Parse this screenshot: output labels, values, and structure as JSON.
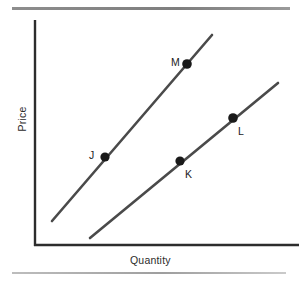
{
  "figure": {
    "kind": "supply-curve-diagram",
    "background_color": "#ffffff",
    "line_color": "#4a4a4a",
    "axis_color": "#2d2d2d",
    "point_color": "#1a1a1a",
    "rule_color": "#8a8a8a"
  },
  "axes": {
    "x_label": "Quantity",
    "y_label": "Price",
    "origin": {
      "x": 34,
      "y": 246
    },
    "x_axis_end": {
      "x": 299,
      "y": 246
    },
    "y_axis_top": {
      "x": 34,
      "y": 20
    },
    "ticks": [],
    "grid": false
  },
  "rules": {
    "top": {
      "x1": 12,
      "y1": 8,
      "x2": 290,
      "y2": 8
    },
    "bottom": {
      "x1": 12,
      "y1": 273,
      "x2": 286,
      "y2": 273
    }
  },
  "chart_data": {
    "type": "line",
    "title": "",
    "subtitle": "",
    "xlabel": "Quantity",
    "ylabel": "Price",
    "xlim": [
      34,
      299
    ],
    "ylim": [
      246,
      20
    ],
    "grid": false,
    "legend": "none",
    "axis_ticks": {
      "x": [],
      "y": []
    },
    "series": [
      {
        "name": "supply-curve-left",
        "type": "line",
        "slope_sign": "positive",
        "x": [
          52,
          212
        ],
        "y": [
          221,
          35
        ],
        "points": [
          {
            "label": "J",
            "x": 105,
            "y": 157,
            "label_position": "left"
          },
          {
            "label": "M",
            "x": 187,
            "y": 64,
            "label_position": "left"
          }
        ]
      },
      {
        "name": "supply-curve-right",
        "type": "line",
        "slope_sign": "positive",
        "x": [
          90,
          278
        ],
        "y": [
          238,
          83
        ],
        "points": [
          {
            "label": "K",
            "x": 180,
            "y": 161,
            "label_position": "below-right"
          },
          {
            "label": "L",
            "x": 233,
            "y": 118,
            "label_position": "below-right"
          }
        ]
      }
    ],
    "annotations": [
      {
        "text": "J",
        "x": 105,
        "y": 157
      },
      {
        "text": "M",
        "x": 187,
        "y": 64
      },
      {
        "text": "K",
        "x": 180,
        "y": 161
      },
      {
        "text": "L",
        "x": 233,
        "y": 118
      }
    ]
  },
  "labels": {
    "J": "J",
    "K": "K",
    "L": "L",
    "M": "M"
  }
}
